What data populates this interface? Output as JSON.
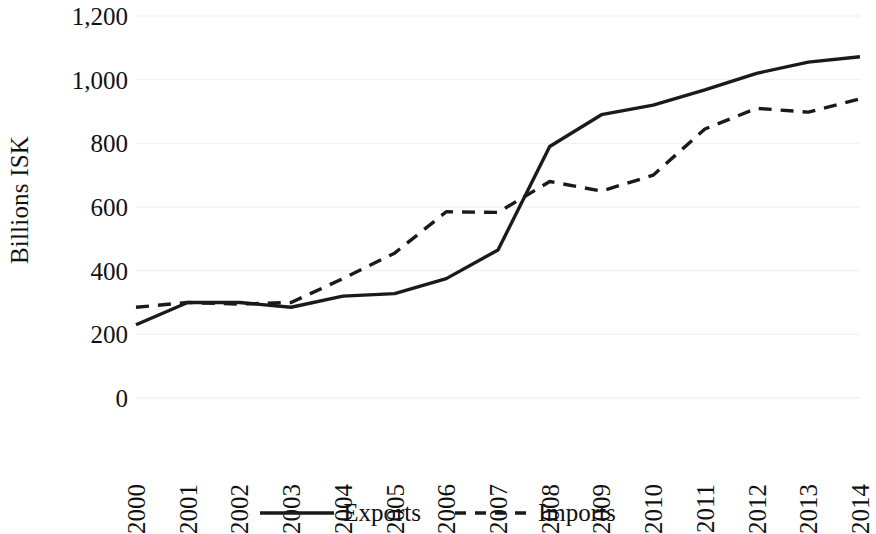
{
  "chart_data": {
    "type": "line",
    "title": "",
    "subtitle": "",
    "xlabel": "",
    "ylabel": "Billions ISK",
    "categories": [
      "2000",
      "2001",
      "2002",
      "2003",
      "2004",
      "2005",
      "2006",
      "2007",
      "2008",
      "2009",
      "2010",
      "2011",
      "2012",
      "2013",
      "2014"
    ],
    "series": [
      {
        "name": "Exports",
        "style": "solid",
        "color": "#1a1a1a",
        "values": [
          230,
          300,
          300,
          285,
          320,
          328,
          375,
          465,
          790,
          890,
          920,
          968,
          1020,
          1055,
          1072
        ]
      },
      {
        "name": "Imports",
        "style": "dashed",
        "color": "#1a1a1a",
        "values": [
          285,
          300,
          295,
          300,
          375,
          455,
          585,
          583,
          680,
          650,
          700,
          845,
          910,
          898,
          940
        ]
      }
    ],
    "ylim": [
      0,
      1200
    ],
    "yticks": [
      0,
      200,
      400,
      600,
      800,
      1000,
      1200
    ],
    "ytick_labels": [
      "0",
      "200",
      "400",
      "600",
      "800",
      "1,000",
      "1,200"
    ],
    "grid": true,
    "grid_color": "#f2f2f2",
    "legend_position": "bottom"
  },
  "axes": {
    "y_title": "Billions ISK"
  },
  "legend": {
    "items": [
      {
        "label": "Exports",
        "style": "solid"
      },
      {
        "label": "Imports",
        "style": "dashed"
      }
    ]
  }
}
